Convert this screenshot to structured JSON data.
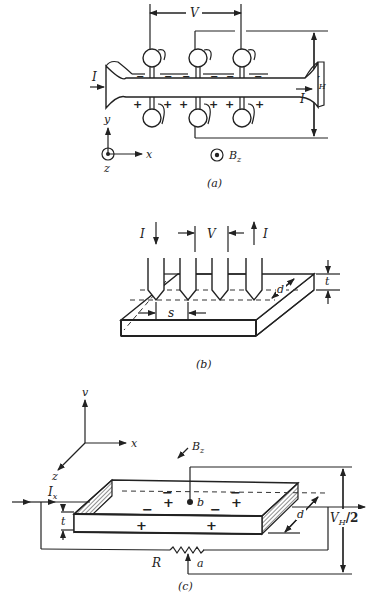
{
  "figure": {
    "panel_a": {
      "caption": "(a)",
      "labels": {
        "current_in": "I",
        "current_out": "I",
        "voltage": "V",
        "hall_voltage": "V",
        "hall_voltage_sub": "H",
        "axis_y": "y",
        "axis_x": "x",
        "axis_z": "z",
        "magnetic_field": "B",
        "magnetic_field_sub": "z"
      },
      "charges_top": [
        "−",
        "−",
        "−",
        "−",
        "−",
        "−"
      ],
      "charges_bottom": [
        "+",
        "+",
        "+",
        "+",
        "+",
        "+"
      ]
    },
    "panel_b": {
      "caption": "(b)",
      "labels": {
        "current_in": "I",
        "current_out": "I",
        "voltage": "V",
        "spacing": "s",
        "depth": "d",
        "thickness": "t"
      },
      "probe_count": 4
    },
    "panel_c": {
      "caption": "(c)",
      "labels": {
        "axis_y": "v",
        "axis_x": "x",
        "axis_z": "z",
        "magnetic_field": "B",
        "magnetic_field_sub": "z",
        "current": "I",
        "current_sub": "x",
        "thickness": "t",
        "depth": "d",
        "point_b": "b",
        "point_a": "a",
        "resistor": "R",
        "hall_voltage": "V",
        "hall_voltage_sub": "H",
        "hall_voltage_suffix": "/2"
      },
      "charges_minus": [
        "−",
        "−",
        "−",
        "−"
      ],
      "charges_plus": [
        "+",
        "+",
        "+",
        "+"
      ]
    }
  }
}
